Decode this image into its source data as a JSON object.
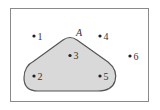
{
  "diagram": {
    "type": "venn",
    "universal_set": {
      "label": "",
      "border_color": "#8a8a8a",
      "fill": "#ffffff"
    },
    "subset": {
      "label": "A",
      "fill": "#d9d9d9",
      "stroke": "#555555",
      "members": [
        "2",
        "3",
        "5"
      ]
    },
    "points": [
      {
        "id": "1",
        "label": "1",
        "in_A": false
      },
      {
        "id": "2",
        "label": "2",
        "in_A": true
      },
      {
        "id": "3",
        "label": "3",
        "in_A": true
      },
      {
        "id": "4",
        "label": "4",
        "in_A": false
      },
      {
        "id": "5",
        "label": "5",
        "in_A": true
      },
      {
        "id": "6",
        "label": "6",
        "in_A": false
      }
    ]
  }
}
